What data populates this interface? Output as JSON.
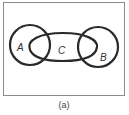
{
  "diagram": {
    "type": "venn",
    "caption": "(a)",
    "sets": [
      {
        "id": "A",
        "label": "A",
        "shape": "circle"
      },
      {
        "id": "B",
        "label": "B",
        "shape": "circle"
      },
      {
        "id": "C",
        "label": "C",
        "shape": "ellipse"
      }
    ],
    "relations": [
      "C overlaps A",
      "C overlaps B",
      "A and B are disjoint"
    ],
    "colors": {
      "stroke": "#2a2a2a",
      "frame": "#8a8a8a",
      "background": "#ffffff"
    }
  }
}
